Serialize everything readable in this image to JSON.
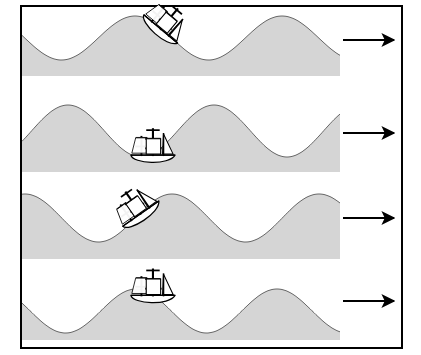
{
  "figure": {
    "background_color": "#ffffff",
    "frame": {
      "name": "outer-border",
      "x": 20,
      "y": 5,
      "width": 383,
      "height": 344,
      "stroke_color": "#000000",
      "stroke_width": 2,
      "fill": "#ffffff"
    },
    "water_fill_color": "#d5d5d5",
    "water_outline_color": "#666666",
    "water_outline_width": 1,
    "ship_ink_color": "#000000",
    "ship_sail_color": "#ffffff",
    "arrow_color": "#000000",
    "band_left": 22,
    "band_right": 340
  },
  "panels": [
    {
      "id": "panel-1",
      "label": "Phase 1 — ship on the forward (descending) face of the crest, bow pitched down",
      "top": 10,
      "bottom": 76,
      "wave": {
        "amplitude": 22,
        "mean_level": 38,
        "wavelength": 147,
        "phase_offset": -12,
        "crest_positions": [
          75,
          222
        ],
        "trough_positions": [
          148,
          295
        ]
      },
      "ship": {
        "x": 160,
        "y": 27,
        "scale": 1.0,
        "rotation_deg": 40,
        "heeling": "bow-down"
      },
      "arrow": {
        "x1": 343,
        "y": 40,
        "x2": 398
      }
    },
    {
      "id": "panel-2",
      "label": "Phase 2 — ship riding on top of the crest, upright",
      "top": 80,
      "bottom": 172,
      "wave": {
        "amplitude": 26,
        "mean_level": 131,
        "wavelength": 146,
        "phase_offset": 68,
        "crest_positions": [
          155,
          301
        ],
        "trough_positions": [
          82,
          228
        ]
      },
      "ship": {
        "x": 152,
        "y": 100,
        "scale": 1.0,
        "rotation_deg": 0,
        "heeling": "level"
      },
      "arrow": {
        "x1": 343,
        "y": 133,
        "x2": 398
      }
    },
    {
      "id": "panel-3",
      "label": "Phase 3 — ship on the rear (ascending) face of the crest, bow pitched up",
      "top": 185,
      "bottom": 259,
      "wave": {
        "amplitude": 24,
        "mean_level": 218,
        "wavelength": 147,
        "phase_offset": 25,
        "crest_positions": [
          45,
          192,
          339
        ],
        "trough_positions": [
          118,
          265
        ]
      },
      "ship": {
        "x": 140,
        "y": 208,
        "scale": 1.0,
        "rotation_deg": -35,
        "heeling": "bow-up"
      },
      "arrow": {
        "x1": 343,
        "y": 218,
        "x2": 398
      }
    },
    {
      "id": "panel-4",
      "label": "Phase 4 — ship settled in the trough between two crests, upright",
      "top": 275,
      "bottom": 340,
      "wave": {
        "amplitude": 22,
        "mean_level": 311,
        "wavelength": 141,
        "phase_offset": -5,
        "crest_positions": [
          75,
          216,
          357
        ],
        "trough_positions": [
          146,
          287
        ]
      },
      "ship": {
        "x": 152,
        "y": 287,
        "scale": 1.0,
        "rotation_deg": 0,
        "heeling": "level"
      },
      "arrow": {
        "x1": 343,
        "y": 301,
        "x2": 398
      }
    }
  ],
  "arrows": {
    "name": "wave-direction-arrow",
    "count": 4,
    "direction": "right",
    "meaning": "direction of wave propagation",
    "shaft_width": 2,
    "head_length": 10,
    "head_width": 9
  },
  "ship_drawing": {
    "name": "sailing-ship",
    "masts": 3,
    "hull_style": "curved-keel",
    "sails": [
      "foresail",
      "mainsail",
      "mizzen-lateen"
    ],
    "description": "three-masted square-rigged sailing ship outlined in black with white sails"
  }
}
